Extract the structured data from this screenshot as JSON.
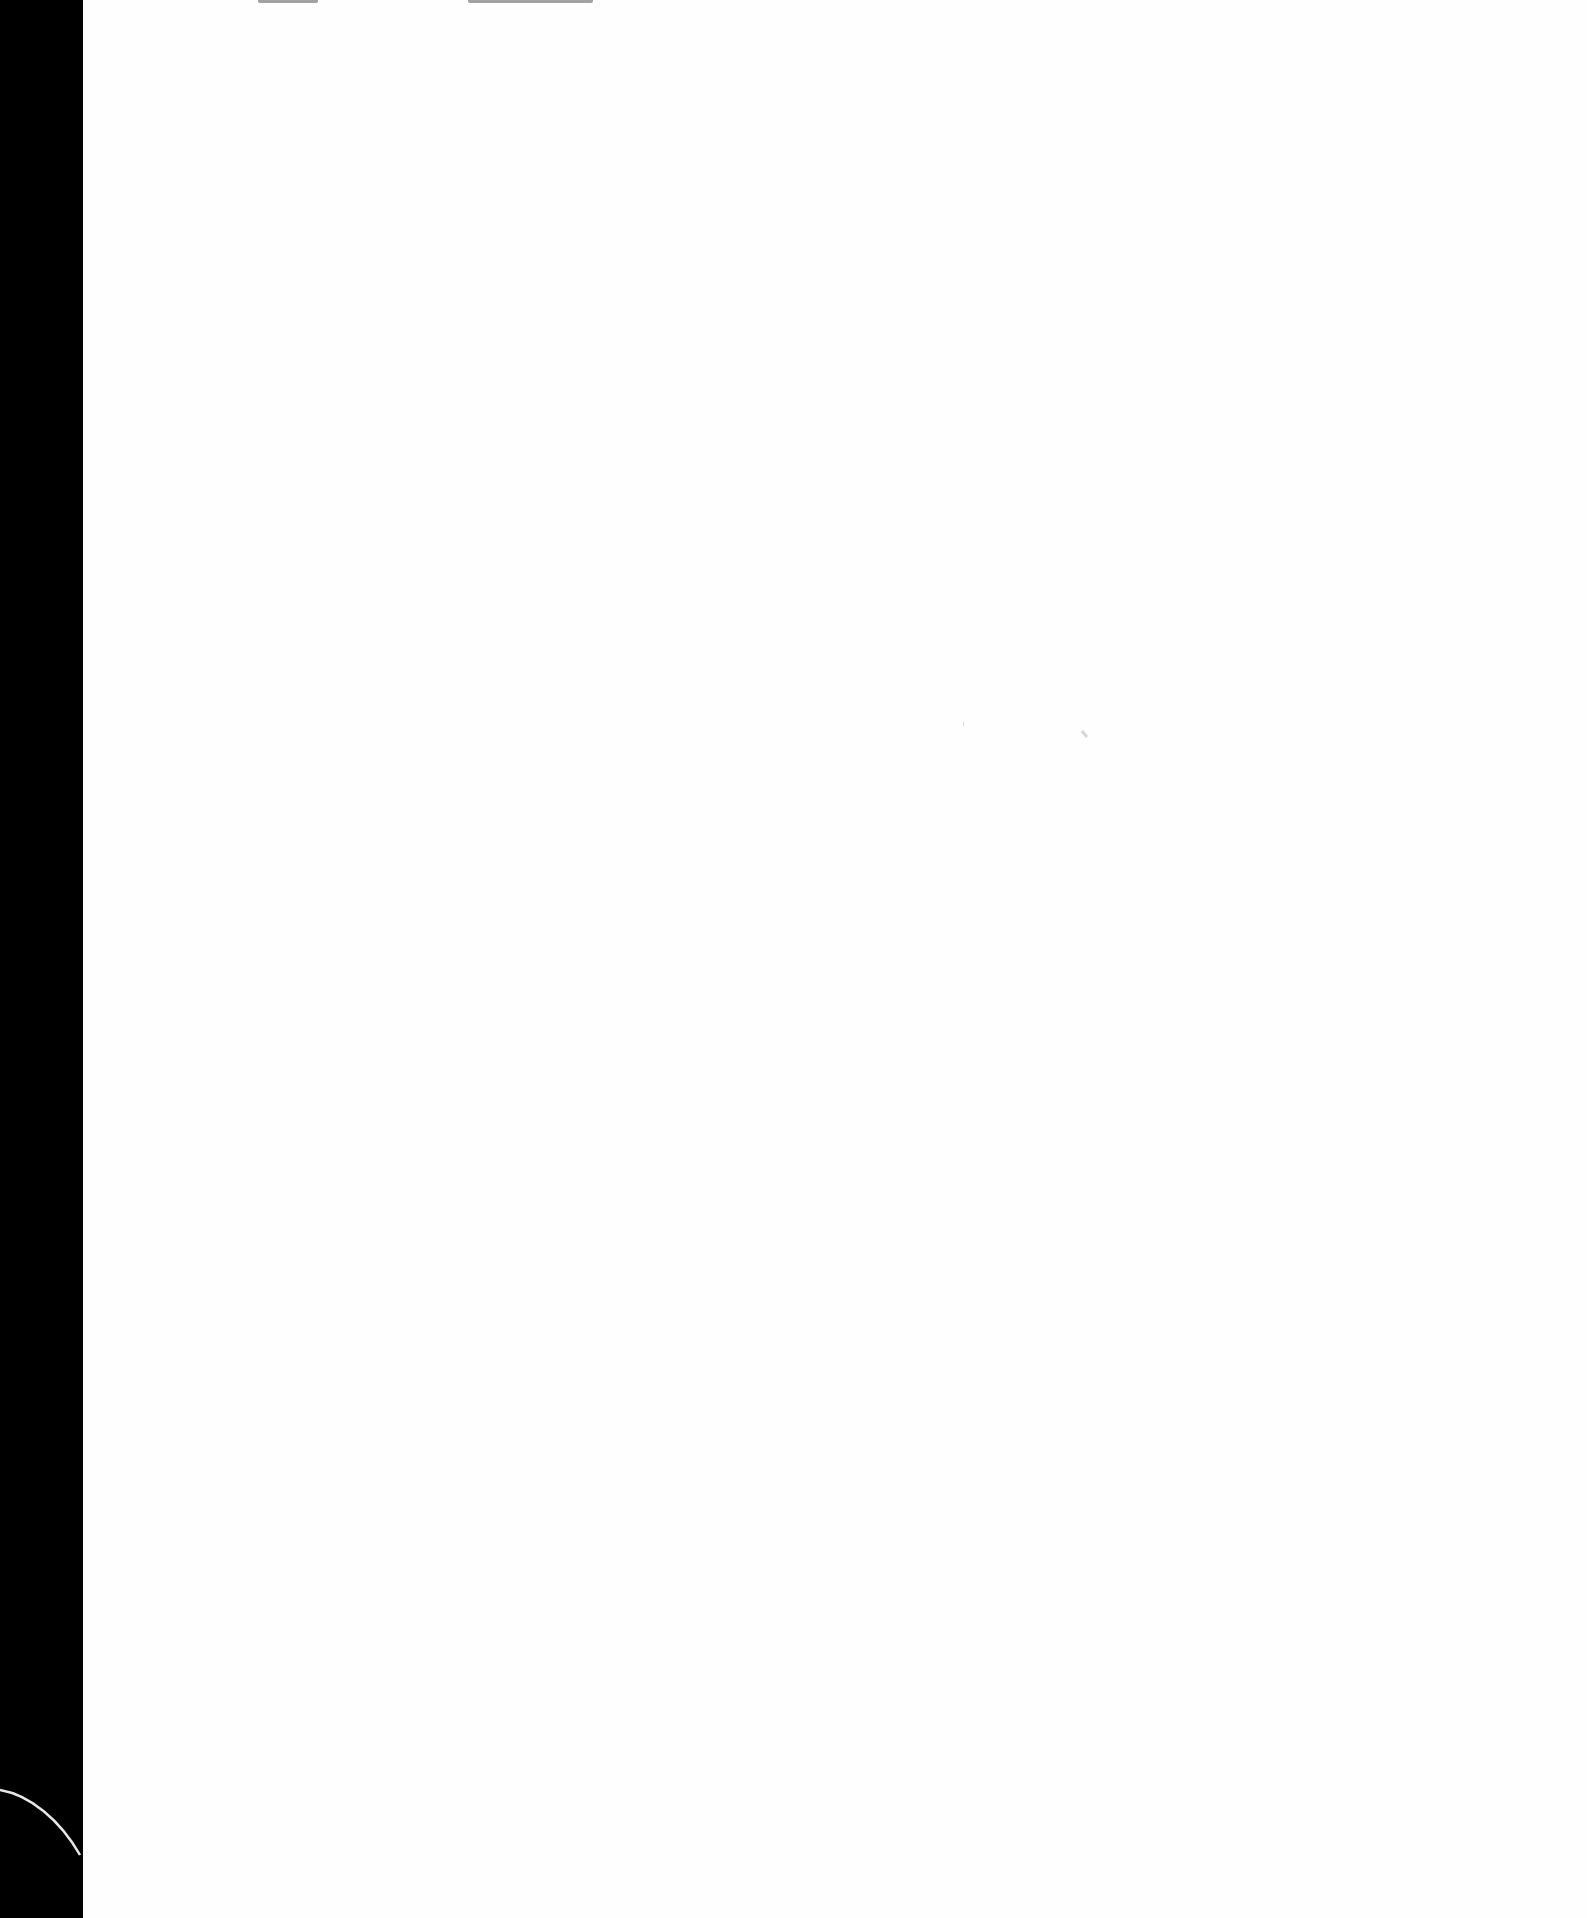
{
  "document": {
    "type": "scanned-page",
    "content": "",
    "left_band_color": "#000000",
    "page_color": "#ffffff"
  }
}
